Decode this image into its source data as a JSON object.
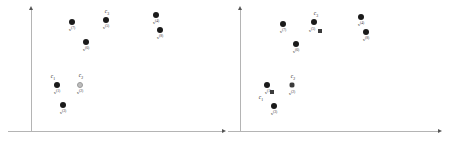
{
  "figure": {
    "width": 456,
    "height": 143,
    "background": "#ffffff",
    "colors": {
      "axis": "#b4b4b4",
      "arrow": "#555555",
      "point_filled": "#1a1a1a",
      "point_hollow": "#bdbdbd",
      "point_hollow_border": "#9a9a9a",
      "centroid": "#3b3b3b",
      "point_label_text": "#2b2b2b",
      "cluster_label_text": "#1a1a1a"
    }
  },
  "panels": [
    {
      "id": "panel-left",
      "name": "left-plot",
      "origin_x": 0,
      "axes": {
        "y_axis": {
          "x": 31,
          "top": 10,
          "bottom": 132
        },
        "x_axis": {
          "y": 131,
          "left": 8,
          "right": 222
        }
      },
      "points": [
        {
          "id": "x7",
          "label": "x",
          "index": "(7)",
          "cx": 72,
          "cy": 22,
          "r": 3.0,
          "style": "filled",
          "label_x": 72,
          "label_y": 27
        },
        {
          "id": "x5",
          "label": "x",
          "index": "(5)",
          "cx": 106,
          "cy": 20,
          "r": 3.0,
          "style": "filled",
          "label_x": 106,
          "label_y": 25
        },
        {
          "id": "x4",
          "label": "x",
          "index": "(4)",
          "cx": 156,
          "cy": 15,
          "r": 3.0,
          "style": "filled",
          "label_x": 156,
          "label_y": 20
        },
        {
          "id": "x8",
          "label": "x",
          "index": "(8)",
          "cx": 160,
          "cy": 30,
          "r": 3.0,
          "style": "filled",
          "label_x": 160,
          "label_y": 35
        },
        {
          "id": "x6",
          "label": "x",
          "index": "(6)",
          "cx": 86,
          "cy": 42,
          "r": 3.0,
          "style": "filled",
          "label_x": 86,
          "label_y": 47
        },
        {
          "id": "x1",
          "label": "x",
          "index": "(1)",
          "cx": 57,
          "cy": 85,
          "r": 3.0,
          "style": "filled",
          "label_x": 57,
          "label_y": 90
        },
        {
          "id": "x2",
          "label": "x",
          "index": "(2)",
          "cx": 80,
          "cy": 85,
          "r": 3.0,
          "style": "hollow",
          "label_x": 80,
          "label_y": 90
        },
        {
          "id": "x3",
          "label": "x",
          "index": "(3)",
          "cx": 63,
          "cy": 105,
          "r": 3.0,
          "style": "filled",
          "label_x": 63,
          "label_y": 110
        }
      ],
      "cluster_labels": [
        {
          "id": "c3",
          "letter": "c",
          "sub": "3",
          "x": 107,
          "y": 9
        },
        {
          "id": "c1",
          "letter": "c",
          "sub": "1",
          "x": 53,
          "y": 74
        },
        {
          "id": "c2",
          "letter": "c",
          "sub": "2",
          "x": 81,
          "y": 73
        }
      ],
      "centroids": []
    },
    {
      "id": "panel-right",
      "name": "right-plot",
      "origin_x": 228,
      "axes": {
        "y_axis": {
          "x": 12,
          "top": 10,
          "bottom": 132
        },
        "x_axis": {
          "y": 131,
          "left": 0,
          "right": 210
        }
      },
      "points": [
        {
          "id": "x7",
          "label": "x",
          "index": "(7)",
          "cx": 55,
          "cy": 24,
          "r": 3.0,
          "style": "filled",
          "label_x": 55,
          "label_y": 29
        },
        {
          "id": "x5",
          "label": "x",
          "index": "(5)",
          "cx": 86,
          "cy": 22,
          "r": 3.0,
          "style": "filled",
          "label_x": 84,
          "label_y": 28
        },
        {
          "id": "x4",
          "label": "x",
          "index": "(4)",
          "cx": 133,
          "cy": 17,
          "r": 3.0,
          "style": "filled",
          "label_x": 133,
          "label_y": 22
        },
        {
          "id": "x8",
          "label": "x",
          "index": "(8)",
          "cx": 138,
          "cy": 32,
          "r": 3.0,
          "style": "filled",
          "label_x": 138,
          "label_y": 37
        },
        {
          "id": "x6",
          "label": "x",
          "index": "(6)",
          "cx": 68,
          "cy": 44,
          "r": 3.0,
          "style": "filled",
          "label_x": 68,
          "label_y": 49
        },
        {
          "id": "x1",
          "label": "x",
          "index": "(1)",
          "cx": 39,
          "cy": 85,
          "r": 3.0,
          "style": "filled",
          "label_x": 40,
          "label_y": 90
        },
        {
          "id": "x2",
          "label": "x",
          "index": "(2)",
          "cx": 64,
          "cy": 85,
          "r": 3.0,
          "style": "hollow",
          "label_x": 64,
          "label_y": 91
        },
        {
          "id": "x3",
          "label": "x",
          "index": "(3)",
          "cx": 46,
          "cy": 106,
          "r": 3.0,
          "style": "filled",
          "label_x": 46,
          "label_y": 111
        }
      ],
      "cluster_labels": [
        {
          "id": "c3",
          "letter": "c",
          "sub": "3",
          "x": 88,
          "y": 11
        },
        {
          "id": "c2",
          "letter": "c",
          "sub": "2",
          "x": 65,
          "y": 74
        },
        {
          "id": "c1",
          "letter": "c",
          "sub": "1",
          "x": 33,
          "y": 95
        }
      ],
      "centroids": [
        {
          "id": "centroid-c3",
          "cx": 92,
          "cy": 31,
          "size": 4.0
        },
        {
          "id": "centroid-c2",
          "cx": 64,
          "cy": 85,
          "size": 4.0
        },
        {
          "id": "centroid-c1",
          "cx": 44,
          "cy": 92,
          "size": 4.0
        }
      ]
    }
  ]
}
